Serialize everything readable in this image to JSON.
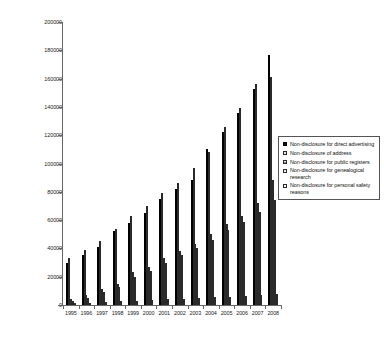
{
  "chart_data": {
    "type": "bar",
    "title": "",
    "subtitle": "",
    "xlabel": "",
    "ylabel": "",
    "ylim": [
      0,
      200000
    ],
    "ytick_step": 20000,
    "ytick_labels": [
      "200000",
      "180000",
      "160000",
      "140000",
      "120000",
      "100000",
      "80000",
      "60000",
      "40000",
      "20000",
      "0"
    ],
    "grid": false,
    "legend_position": "right",
    "categories": [
      "1995",
      "1996",
      "1997",
      "1998",
      "1999",
      "2000",
      "2001",
      "2002",
      "2003",
      "2004",
      "2005",
      "2006",
      "2007",
      "2008"
    ],
    "series": [
      {
        "name": "Non-disclosure for direct advertising",
        "values": [
          30000,
          35000,
          41000,
          52000,
          58000,
          65000,
          75000,
          82000,
          88000,
          110000,
          122000,
          136000,
          153000,
          177000
        ]
      },
      {
        "name": "Non-disclosure of address",
        "values": [
          33000,
          39000,
          45000,
          54000,
          63000,
          70000,
          79000,
          86000,
          97000,
          108000,
          126000,
          139000,
          156000,
          161000
        ]
      },
      {
        "name": "Non-disclosure for public registers",
        "values": [
          4000,
          7000,
          11000,
          15000,
          23000,
          27000,
          33000,
          38000,
          43000,
          50000,
          57000,
          63000,
          72000,
          88000
        ]
      },
      {
        "name": "Non-disclosure for genealogical research",
        "values": [
          3000,
          5000,
          9000,
          13000,
          20000,
          24000,
          30000,
          35000,
          40000,
          46000,
          53000,
          59000,
          66000,
          74000
        ]
      },
      {
        "name": "Non-disclosure for personal safety reasons",
        "values": [
          1000,
          1500,
          2000,
          2500,
          3000,
          3500,
          4000,
          4500,
          5000,
          5500,
          6000,
          6500,
          7000,
          8000
        ]
      }
    ]
  },
  "legend": {
    "items": [
      "Non-disclosure for direct advertising",
      "Non-disclosure of address",
      "Non-disclosure for public registers",
      "Non-disclosure for genealogical research",
      "Non-disclosure for personal safety reasons"
    ]
  },
  "colors": {
    "series_0": "#111111",
    "series_1": "#e8e8e8",
    "series_2": "#f2f2f2",
    "series_3": "#f4f4f4",
    "series_4": "#f7f7f7",
    "axis": "#666666",
    "text": "#1a1a1a",
    "background": "#ffffff"
  }
}
